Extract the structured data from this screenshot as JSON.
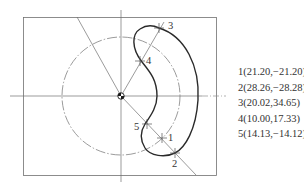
{
  "diagram": {
    "type": "cam-slot-profile",
    "colors": {
      "thin_line": "#707070",
      "thick_line": "#2a2a2a",
      "background": "#ffffff"
    },
    "point_labels": [
      "1",
      "2",
      "3",
      "4",
      "5"
    ],
    "coordinates": [
      "1(21.20,−21.20)",
      "2(28.26,−28.28)",
      "3(20.02,34.65)",
      "4(10.00,17.33)",
      "5(14.13,−14.12)"
    ]
  }
}
